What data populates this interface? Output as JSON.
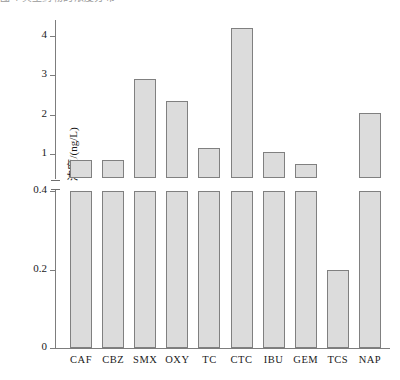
{
  "caption_fragment": "图 4  典型药物的浓度分布",
  "chart_data": {
    "type": "bar",
    "title": "",
    "subtitle": "",
    "xlabel": "",
    "ylabel": "浓度/(ng/L)",
    "categories": [
      "CAF",
      "CBZ",
      "SMX",
      "OXY",
      "TC",
      "CTC",
      "IBU",
      "GEM",
      "TCS",
      "NAP"
    ],
    "values": [
      0.85,
      0.85,
      2.9,
      2.35,
      1.15,
      4.2,
      1.05,
      0.75,
      0.2,
      2.05
    ],
    "series": [
      {
        "name": "浓度",
        "values": [
          0.85,
          0.85,
          2.9,
          2.35,
          1.15,
          4.2,
          1.05,
          0.75,
          0.2,
          2.05
        ]
      }
    ],
    "broken_axis": true,
    "axis_break_between": [
      0.4,
      1.0
    ],
    "lower_ticks": [
      "0",
      "0.2",
      "0.4"
    ],
    "lower_tick_values": [
      0,
      0.2,
      0.4
    ],
    "upper_ticks": [
      "1",
      "2",
      "3",
      "4"
    ],
    "upper_tick_values": [
      1,
      2,
      3,
      4
    ],
    "ylim_lower": [
      0,
      0.4
    ],
    "ylim_upper": [
      0.4,
      4.55
    ],
    "grid": false,
    "legend": "none",
    "bar_fill_color": "#dcdcdc",
    "bar_edge_color": "#808080",
    "axis_color": "#7d7d7d"
  }
}
